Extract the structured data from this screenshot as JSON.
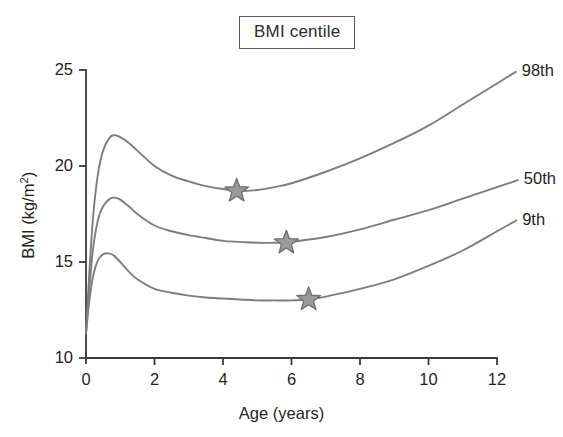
{
  "title": {
    "text": "BMI centile"
  },
  "axes": {
    "x": {
      "label": "Age (years)",
      "ticks": [
        "0",
        "2",
        "4",
        "6",
        "8",
        "10",
        "12"
      ],
      "min": 0,
      "max": 12
    },
    "y": {
      "label_prefix": "BMI (kg/m",
      "label_exponent": "2",
      "label_suffix": ")",
      "label_full": "BMI (kg/m2)",
      "ticks": [
        "10",
        "15",
        "20",
        "25"
      ],
      "min": 10,
      "max": 25
    }
  },
  "colors": {
    "curve": "#7d7d7d",
    "axis": "#3b3b3b",
    "star_fill": "#9a9a9a",
    "star_stroke": "#6e6e6e",
    "text": "#231f20",
    "title_border": "#5b5b5b",
    "background": "#ffffff"
  },
  "series_labels": [
    {
      "name": "98th",
      "text": "98th"
    },
    {
      "name": "50th",
      "text": "50th"
    },
    {
      "name": "9th",
      "text": "9th"
    }
  ],
  "chart_data": {
    "type": "line",
    "title": "BMI centile",
    "xlabel": "Age (years)",
    "ylabel": "BMI (kg/m2)",
    "xlim": [
      0,
      12
    ],
    "ylim": [
      10,
      25
    ],
    "xticks": [
      0,
      2,
      4,
      6,
      8,
      10,
      12
    ],
    "yticks": [
      10,
      15,
      20,
      25
    ],
    "grid": false,
    "legend": "inline-right-of-curve-ends",
    "series": [
      {
        "name": "98th",
        "label": "98th",
        "color": "#7d7d7d",
        "x": [
          0,
          0.08,
          0.2,
          0.35,
          0.5,
          0.7,
          0.85,
          1.0,
          1.25,
          1.5,
          2.0,
          2.5,
          3.0,
          3.5,
          4.0,
          4.4,
          5.0,
          5.5,
          6.0,
          7.0,
          8.0,
          9.0,
          10.0,
          11.0,
          12.0
        ],
        "y": [
          11.3,
          13.9,
          17.2,
          19.6,
          20.8,
          21.5,
          21.6,
          21.5,
          21.2,
          20.8,
          20.0,
          19.5,
          19.2,
          18.95,
          18.8,
          18.7,
          18.75,
          18.9,
          19.1,
          19.7,
          20.4,
          21.2,
          22.1,
          23.2,
          24.3
        ]
      },
      {
        "name": "50th",
        "label": "50th",
        "color": "#7d7d7d",
        "x": [
          0,
          0.08,
          0.2,
          0.35,
          0.5,
          0.7,
          0.85,
          1.0,
          1.25,
          1.5,
          2.0,
          2.5,
          3.0,
          3.5,
          4.0,
          4.5,
          5.0,
          5.5,
          5.85,
          6.0,
          7.0,
          8.0,
          9.0,
          10.0,
          11.0,
          12.0
        ],
        "y": [
          11.3,
          13.2,
          15.6,
          17.2,
          17.9,
          18.3,
          18.35,
          18.25,
          17.9,
          17.5,
          16.9,
          16.6,
          16.4,
          16.25,
          16.1,
          16.05,
          16.0,
          16.0,
          16.0,
          16.05,
          16.3,
          16.7,
          17.2,
          17.7,
          18.3,
          18.9
        ]
      },
      {
        "name": "9th",
        "label": "9th",
        "color": "#7d7d7d",
        "x": [
          0,
          0.08,
          0.2,
          0.35,
          0.5,
          0.65,
          0.8,
          1.0,
          1.25,
          1.5,
          2.0,
          2.5,
          3.0,
          3.5,
          4.0,
          4.5,
          5.0,
          5.5,
          6.0,
          6.5,
          7.0,
          8.0,
          9.0,
          10.0,
          11.0,
          12.0
        ],
        "y": [
          11.25,
          12.7,
          14.2,
          15.1,
          15.4,
          15.45,
          15.35,
          15.0,
          14.5,
          14.1,
          13.6,
          13.4,
          13.25,
          13.15,
          13.1,
          13.05,
          13.0,
          13.0,
          13.0,
          13.05,
          13.2,
          13.6,
          14.1,
          14.8,
          15.6,
          16.6
        ]
      }
    ],
    "markers": [
      {
        "shape": "star",
        "series": "98th",
        "x": 4.4,
        "y": 18.7
      },
      {
        "shape": "star",
        "series": "50th",
        "x": 5.85,
        "y": 16.0
      },
      {
        "shape": "star",
        "series": "9th",
        "x": 6.5,
        "y": 13.05
      }
    ]
  }
}
